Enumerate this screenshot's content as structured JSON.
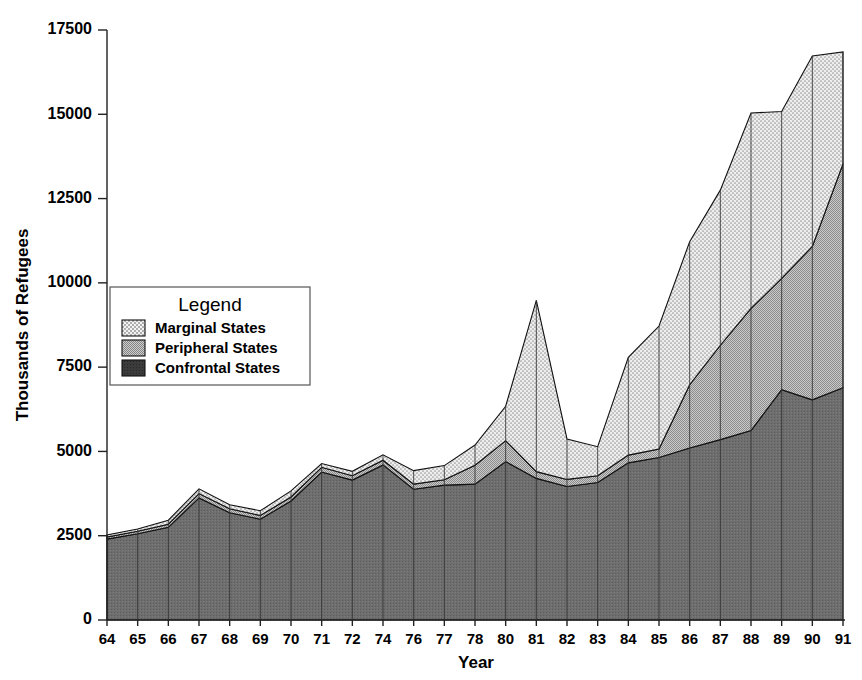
{
  "chart_data": {
    "type": "area",
    "subtype": "stacked-area",
    "title": "",
    "xlabel": "Year",
    "ylabel": "Thousands of Refugees",
    "categories": [
      "64",
      "65",
      "66",
      "67",
      "68",
      "69",
      "70",
      "71",
      "72",
      "74",
      "76",
      "77",
      "78",
      "80",
      "81",
      "82",
      "83",
      "84",
      "85",
      "86",
      "87",
      "88",
      "89",
      "90",
      "91"
    ],
    "x": [
      "64",
      "65",
      "66",
      "67",
      "68",
      "69",
      "70",
      "71",
      "72",
      "74",
      "76",
      "77",
      "78",
      "80",
      "81",
      "82",
      "83",
      "84",
      "85",
      "86",
      "87",
      "88",
      "89",
      "90",
      "91"
    ],
    "ylim": [
      0,
      17500
    ],
    "yticks": [
      0,
      2500,
      5000,
      7500,
      10000,
      12500,
      15000,
      17500
    ],
    "ytick_labels": [
      "0",
      "2500",
      "5000",
      "7500",
      "10000",
      "12500",
      "15000",
      "17500"
    ],
    "xlim_labels": [
      "64",
      "91"
    ],
    "grid": false,
    "legend_position": "inside-left",
    "legend_title": "Legend",
    "stack_order_bottom_to_top": [
      "Confrontal States",
      "Peripheral States",
      "Marginal States"
    ],
    "series": [
      {
        "name": "Confrontal States",
        "fill": "#6b6b6b",
        "pattern": "solid-dark",
        "values": [
          2400,
          2560,
          2750,
          3620,
          3180,
          2990,
          3530,
          4390,
          4150,
          4600,
          3880,
          4000,
          4030,
          4700,
          4200,
          3960,
          4080,
          4660,
          4820,
          5100,
          5350,
          5620,
          6830,
          6530,
          6890
        ]
      },
      {
        "name": "Peripheral States",
        "fill": "#b8b8b8",
        "pattern": "fine-dots-mid",
        "values": [
          60,
          70,
          90,
          130,
          120,
          110,
          120,
          140,
          130,
          140,
          150,
          160,
          560,
          620,
          200,
          210,
          200,
          230,
          250,
          1880,
          2800,
          3620,
          3300,
          4550,
          6640
        ]
      },
      {
        "name": "Marginal States",
        "fill": "#e2e2e2",
        "pattern": "coarse-dots-light",
        "values": [
          60,
          70,
          120,
          140,
          120,
          140,
          180,
          110,
          130,
          160,
          400,
          420,
          600,
          1020,
          5080,
          1200,
          860,
          2900,
          3650,
          4240,
          4600,
          5800,
          4950,
          5650,
          3320
        ]
      }
    ],
    "totals": [
      2520,
      2700,
      2960,
      3890,
      3420,
      3240,
      3830,
      4640,
      4410,
      4900,
      4430,
      4580,
      5190,
      6340,
      9480,
      5370,
      5140,
      7790,
      8720,
      11220,
      12750,
      15040,
      15080,
      16730,
      16850
    ],
    "annotations": [
      {
        "label": "peak",
        "x": "81",
        "y": 9480
      },
      {
        "label": "maximum",
        "x": "91",
        "y": 16850
      }
    ]
  },
  "legend": {
    "title": "Legend",
    "items": [
      {
        "label": "Marginal States",
        "swatch": "coarse-dots-light"
      },
      {
        "label": "Peripheral States",
        "swatch": "fine-dots-mid"
      },
      {
        "label": "Confrontal States",
        "swatch": "solid-dark"
      }
    ]
  },
  "axes": {
    "x_title": "Year",
    "y_title": "Thousands of Refugees"
  }
}
